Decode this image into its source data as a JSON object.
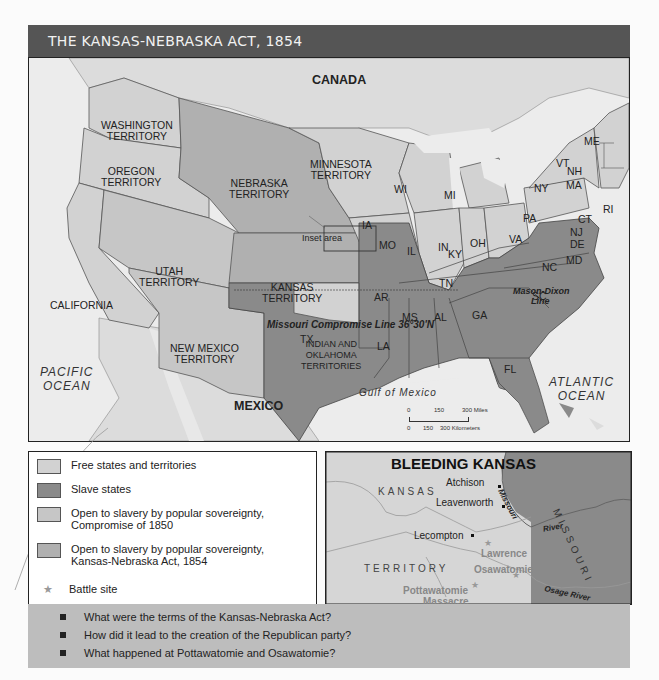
{
  "title": "THE KANSAS-NEBRASKA ACT, 1854",
  "colors": {
    "free": "#d2d2d2",
    "slave": "#8a8a8a",
    "popular_1850": "#c6c6c6",
    "popular_1854": "#b0b0b0",
    "water": "#ececec",
    "foreign": "#dcdcdc",
    "header": "#555555",
    "questions_bg": "#bdbdbd"
  },
  "map": {
    "countries": [
      "CANADA",
      "MEXICO"
    ],
    "oceans": [
      "PACIFIC OCEAN",
      "ATLANTIC OCEAN",
      "Gulf of Mexico"
    ],
    "territories": [
      {
        "name": "WASHINGTON TERRITORY",
        "category": "free"
      },
      {
        "name": "OREGON TERRITORY",
        "category": "free"
      },
      {
        "name": "MINNESOTA TERRITORY",
        "category": "free"
      },
      {
        "name": "NEBRASKA TERRITORY",
        "category": "popular_1854"
      },
      {
        "name": "KANSAS TERRITORY",
        "category": "popular_1854"
      },
      {
        "name": "UTAH TERRITORY",
        "category": "popular_1850"
      },
      {
        "name": "NEW MEXICO TERRITORY",
        "category": "popular_1850"
      },
      {
        "name": "INDIAN AND OKLAHOMA TERRITORIES",
        "category": "free"
      }
    ],
    "free_states": [
      "CALIFORNIA",
      "WI",
      "MI",
      "IA",
      "IL",
      "IN",
      "OH",
      "PA",
      "NY",
      "VT",
      "NH",
      "ME",
      "MA",
      "RI",
      "CT",
      "NJ"
    ],
    "slave_states": [
      "MO",
      "KY",
      "VA",
      "TN",
      "NC",
      "SC",
      "AR",
      "MS",
      "AL",
      "GA",
      "LA",
      "TX",
      "FL",
      "DE",
      "MD"
    ],
    "annotations": {
      "inset_area": "Inset area",
      "compromise_line": "Missouri Compromise Line 36°30'N",
      "mason_dixon": "Mason-Dixon",
      "line": "Line"
    },
    "labels": {
      "canada": "CANADA",
      "mexico": "MEXICO",
      "pacific1": "PACIFIC",
      "pacific2": "OCEAN",
      "atlantic1": "ATLANTIC",
      "atlantic2": "OCEAN",
      "gulf": "Gulf of Mexico",
      "wash1": "WASHINGTON",
      "wash2": "TERRITORY",
      "ore1": "OREGON",
      "ore2": "TERRITORY",
      "minn1": "MINNESOTA",
      "minn2": "TERRITORY",
      "neb1": "NEBRASKA",
      "neb2": "TERRITORY",
      "kan1": "KANSAS",
      "kan2": "TERRITORY",
      "utah1": "UTAH",
      "utah2": "TERRITORY",
      "nm1": "NEW MEXICO",
      "nm2": "TERRITORY",
      "ind1": "INDIAN AND",
      "ind2": "OKLAHOMA",
      "ind3": "TERRITORIES",
      "ca": "CALIFORNIA",
      "wi": "WI",
      "mi": "MI",
      "ia": "IA",
      "il": "IL",
      "in": "IN",
      "oh": "OH",
      "pa": "PA",
      "ny": "NY",
      "vt": "VT",
      "nh": "NH",
      "me": "ME",
      "ma": "MA",
      "ri": "RI",
      "ct": "CT",
      "nj": "NJ",
      "de": "DE",
      "md": "MD",
      "mo": "MO",
      "ky": "KY",
      "va": "VA",
      "tn": "TN",
      "nc": "NC",
      "sc": "SC",
      "ar": "AR",
      "ms": "MS",
      "al": "AL",
      "ga": "GA",
      "la": "LA",
      "tx": "TX",
      "fl": "FL"
    },
    "scale": {
      "miles_ticks": [
        "0",
        "150",
        "300 Miles"
      ],
      "km_ticks": [
        "0",
        "150",
        "300 Kilometers"
      ]
    }
  },
  "legend": {
    "items": [
      {
        "label": "Free states and territories",
        "color_key": "free"
      },
      {
        "label": "Slave states",
        "color_key": "slave"
      },
      {
        "label": "Open to slavery by popular sovereignty,",
        "label2": "Compromise of 1850",
        "color_key": "popular_1850"
      },
      {
        "label": "Open to slavery by popular sovereignty,",
        "label2": "Kansas-Nebraska Act, 1854",
        "color_key": "popular_1854"
      },
      {
        "label": "Battle site",
        "icon": "star-icon"
      }
    ]
  },
  "inset": {
    "title": "BLEEDING KANSAS",
    "regions": {
      "kansas": "KANSAS",
      "territory": "TERRITORY",
      "missouri": "MISSOURI"
    },
    "towns": [
      "Atchison",
      "Leavenworth",
      "Lecompton"
    ],
    "battle_sites": [
      "Lawrence",
      "Osawatomie",
      "Pottawatomie",
      "Massacre"
    ],
    "rivers": {
      "missouri": "Missouri",
      "river": "River",
      "osage": "Osage River"
    }
  },
  "questions": [
    "What were the terms of the Kansas-Nebraska Act?",
    "How did it lead to the creation of the Republican party?",
    "What happened at Pottawatomie and Osawatomie?"
  ]
}
